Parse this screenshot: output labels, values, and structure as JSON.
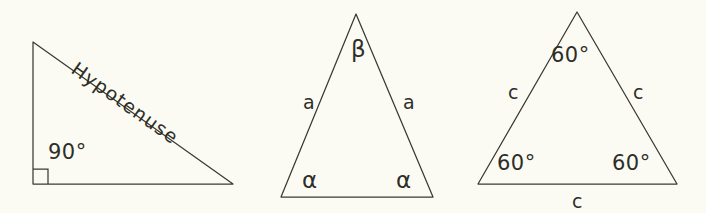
{
  "figure": {
    "background_color": "#fbfbf3",
    "stroke_color": "#3a3a32",
    "text_color": "#2e2e28"
  },
  "triangles": [
    {
      "name": "right-triangle",
      "labels": {
        "hypotenuse": "Hypotenuse",
        "right_angle": "90°"
      },
      "vertices": {
        "top": [
          33,
          42
        ],
        "bottom_left": [
          33,
          184
        ],
        "bottom_right": [
          233,
          184
        ]
      },
      "right_angle_marker": true
    },
    {
      "name": "isosceles-triangle",
      "labels": {
        "apex_angle": "β",
        "base_angle_left": "α",
        "base_angle_right": "α",
        "side_left": "a",
        "side_right": "a"
      },
      "vertices": {
        "apex": [
          356,
          14
        ],
        "bottom_left": [
          281,
          197
        ],
        "bottom_right": [
          433,
          197
        ]
      }
    },
    {
      "name": "equilateral-triangle",
      "labels": {
        "angle_top": "60°",
        "angle_bottom_left": "60°",
        "angle_bottom_right": "60°",
        "side_left": "c",
        "side_right": "c",
        "side_bottom": "c"
      },
      "vertices": {
        "apex": [
          577,
          12
        ],
        "bottom_left": [
          478,
          184
        ],
        "bottom_right": [
          677,
          184
        ]
      }
    }
  ]
}
